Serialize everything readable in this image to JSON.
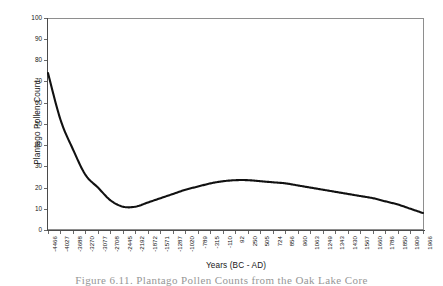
{
  "chart_data": {
    "type": "line",
    "title": "",
    "xlabel": "Years (BC - AD)",
    "ylabel": "Plantago Pollen Count",
    "ylim": [
      0,
      100
    ],
    "ytick_values": [
      0,
      10,
      20,
      30,
      40,
      50,
      60,
      70,
      80,
      90,
      100
    ],
    "ytick_labels": [
      "0",
      "10",
      "20",
      "30",
      "40",
      "50",
      "60",
      "70",
      "80",
      "90",
      "100"
    ],
    "grid": false,
    "legend": "none",
    "line_color": "#111111",
    "categories": [
      "-4466",
      "-4027",
      "-3688",
      "-3270",
      "-3077",
      "-2708",
      "-2445",
      "-2192",
      "-1872",
      "-1571",
      "-1287",
      "-1020",
      "-789",
      "-315",
      "-110",
      "92",
      "250",
      "505",
      "724",
      "856",
      "960",
      "1063",
      "1249",
      "1343",
      "1430",
      "1567",
      "1660",
      "1786",
      "1850",
      "1909",
      "1966"
    ],
    "values": [
      74,
      52,
      38,
      26,
      20,
      14,
      11,
      11,
      13,
      15,
      17,
      19,
      20.5,
      22,
      23,
      23.5,
      23.5,
      23,
      22.5,
      22,
      21,
      20,
      19,
      18,
      17,
      16,
      15,
      13.5,
      12,
      10,
      8
    ],
    "series": [
      {
        "name": "Plantago Pollen Count",
        "values": [
          74,
          52,
          38,
          26,
          20,
          14,
          11,
          11,
          13,
          15,
          17,
          19,
          20.5,
          22,
          23,
          23.5,
          23.5,
          23,
          22.5,
          22,
          21,
          20,
          19,
          18,
          17,
          16,
          15,
          13.5,
          12,
          10,
          8
        ]
      }
    ]
  },
  "caption": {
    "text": "Figure 6.11. Plantago Pollen Counts from the Oak Lake Core"
  }
}
